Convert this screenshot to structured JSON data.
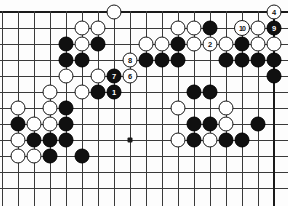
{
  "board": {
    "title": "Go board diagram",
    "type": "go-game-position",
    "columns": 18,
    "rows": 12,
    "origin_x": 2,
    "origin_y": 12,
    "spacing": 16,
    "cut_edges": [
      "left",
      "bottom"
    ],
    "colors": {
      "black_stone": "#101010",
      "white_stone": "#ffffff",
      "grid_line": "#3a3a3a",
      "border_line": "#1a1a1a",
      "background": "#fdfdfd",
      "black_label": "#ffffff",
      "white_label": "#101010"
    },
    "star_points": [
      {
        "col": 8,
        "row": 8
      }
    ],
    "stones": [
      {
        "col": 7,
        "row": 0,
        "color": "white",
        "label": ""
      },
      {
        "col": 11,
        "row": 1,
        "color": "white",
        "label": ""
      },
      {
        "col": 12,
        "row": 1,
        "color": "white",
        "label": ""
      },
      {
        "col": 13,
        "row": 1,
        "color": "black",
        "label": ""
      },
      {
        "col": 15,
        "row": 1,
        "color": "white",
        "label": "10"
      },
      {
        "col": 16,
        "row": 1,
        "color": "white",
        "label": ""
      },
      {
        "col": 17,
        "row": 1,
        "color": "black",
        "label": "9"
      },
      {
        "col": 5,
        "row": 1,
        "color": "white",
        "label": ""
      },
      {
        "col": 6,
        "row": 1,
        "color": "white",
        "label": ""
      },
      {
        "col": 4,
        "row": 2,
        "color": "black",
        "label": ""
      },
      {
        "col": 5,
        "row": 2,
        "color": "white",
        "label": ""
      },
      {
        "col": 6,
        "row": 2,
        "color": "black",
        "label": ""
      },
      {
        "col": 9,
        "row": 2,
        "color": "white",
        "label": ""
      },
      {
        "col": 10,
        "row": 2,
        "color": "white",
        "label": ""
      },
      {
        "col": 11,
        "row": 2,
        "color": "black",
        "label": ""
      },
      {
        "col": 12,
        "row": 2,
        "color": "white",
        "label": ""
      },
      {
        "col": 13,
        "row": 2,
        "color": "white",
        "label": "2"
      },
      {
        "col": 14,
        "row": 2,
        "color": "white",
        "label": ""
      },
      {
        "col": 15,
        "row": 2,
        "color": "black",
        "label": ""
      },
      {
        "col": 16,
        "row": 2,
        "color": "white",
        "label": ""
      },
      {
        "col": 17,
        "row": 2,
        "color": "white",
        "label": ""
      },
      {
        "col": 4,
        "row": 3,
        "color": "black",
        "label": ""
      },
      {
        "col": 5,
        "row": 3,
        "color": "black",
        "label": ""
      },
      {
        "col": 8,
        "row": 3,
        "color": "white",
        "label": "8"
      },
      {
        "col": 9,
        "row": 3,
        "color": "black",
        "label": ""
      },
      {
        "col": 10,
        "row": 3,
        "color": "black",
        "label": ""
      },
      {
        "col": 11,
        "row": 3,
        "color": "black",
        "label": ""
      },
      {
        "col": 14,
        "row": 3,
        "color": "black",
        "label": ""
      },
      {
        "col": 15,
        "row": 3,
        "color": "black",
        "label": ""
      },
      {
        "col": 16,
        "row": 3,
        "color": "black",
        "label": ""
      },
      {
        "col": 17,
        "row": 3,
        "color": "black",
        "label": ""
      },
      {
        "col": 4,
        "row": 4,
        "color": "white",
        "label": ""
      },
      {
        "col": 6,
        "row": 4,
        "color": "white",
        "label": ""
      },
      {
        "col": 7,
        "row": 4,
        "color": "black",
        "label": "7"
      },
      {
        "col": 8,
        "row": 4,
        "color": "white",
        "label": "6"
      },
      {
        "col": 3,
        "row": 5,
        "color": "white",
        "label": ""
      },
      {
        "col": 5,
        "row": 5,
        "color": "white",
        "label": ""
      },
      {
        "col": 6,
        "row": 5,
        "color": "black",
        "label": ""
      },
      {
        "col": 7,
        "row": 5,
        "color": "black",
        "label": "1"
      },
      {
        "col": 1,
        "row": 6,
        "color": "white",
        "label": ""
      },
      {
        "col": 3,
        "row": 6,
        "color": "white",
        "label": ""
      },
      {
        "col": 4,
        "row": 6,
        "color": "black",
        "label": ""
      },
      {
        "col": 1,
        "row": 7,
        "color": "black",
        "label": ""
      },
      {
        "col": 2,
        "row": 7,
        "color": "white",
        "label": ""
      },
      {
        "col": 3,
        "row": 7,
        "color": "white",
        "label": ""
      },
      {
        "col": 4,
        "row": 7,
        "color": "black",
        "label": ""
      },
      {
        "col": 1,
        "row": 8,
        "color": "white",
        "label": ""
      },
      {
        "col": 2,
        "row": 8,
        "color": "black",
        "label": ""
      },
      {
        "col": 3,
        "row": 8,
        "color": "black",
        "label": ""
      },
      {
        "col": 4,
        "row": 8,
        "color": "black",
        "label": ""
      },
      {
        "col": 1,
        "row": 9,
        "color": "white",
        "label": ""
      },
      {
        "col": 2,
        "row": 9,
        "color": "white",
        "label": ""
      },
      {
        "col": 3,
        "row": 9,
        "color": "black",
        "label": ""
      },
      {
        "col": 5,
        "row": 9,
        "color": "black",
        "label": ""
      }
    ],
    "extra_stones": [
      {
        "col": 17,
        "row": 0,
        "color": "white",
        "label": "4"
      },
      {
        "col": 17,
        "row": 4,
        "color": "black",
        "label": ""
      },
      {
        "col": 12,
        "row": 5,
        "color": "black",
        "label": ""
      },
      {
        "col": 13,
        "row": 5,
        "color": "black",
        "label": ""
      },
      {
        "col": 11,
        "row": 6,
        "color": "white",
        "label": ""
      },
      {
        "col": 14,
        "row": 6,
        "color": "white",
        "label": ""
      },
      {
        "col": 12,
        "row": 7,
        "color": "black",
        "label": ""
      },
      {
        "col": 13,
        "row": 7,
        "color": "black",
        "label": ""
      },
      {
        "col": 14,
        "row": 7,
        "color": "white",
        "label": ""
      },
      {
        "col": 16,
        "row": 7,
        "color": "black",
        "label": ""
      },
      {
        "col": 11,
        "row": 8,
        "color": "white",
        "label": ""
      },
      {
        "col": 12,
        "row": 8,
        "color": "black",
        "label": ""
      },
      {
        "col": 13,
        "row": 8,
        "color": "white",
        "label": ""
      },
      {
        "col": 14,
        "row": 8,
        "color": "black",
        "label": ""
      },
      {
        "col": 15,
        "row": 8,
        "color": "black",
        "label": ""
      }
    ]
  },
  "chart_data": {
    "type": "table",
    "move_sequence": [
      {
        "number": "1",
        "color": "black",
        "col": 7,
        "row": 5
      },
      {
        "number": "2",
        "color": "white",
        "col": 13,
        "row": 2
      },
      {
        "number": "3",
        "color": "black",
        "col": 17,
        "row": 2
      },
      {
        "number": "4",
        "color": "white",
        "col": 17,
        "row": 0
      },
      {
        "number": "5",
        "color": "black",
        "col": 18,
        "row": 3
      },
      {
        "number": "6",
        "color": "white",
        "col": 8,
        "row": 4
      },
      {
        "number": "7",
        "color": "black",
        "col": 7,
        "row": 4
      },
      {
        "number": "8",
        "color": "white",
        "col": 8,
        "row": 3
      },
      {
        "number": "9",
        "color": "black",
        "col": 17,
        "row": 1
      },
      {
        "number": "10",
        "color": "white",
        "col": 15,
        "row": 1
      }
    ]
  }
}
